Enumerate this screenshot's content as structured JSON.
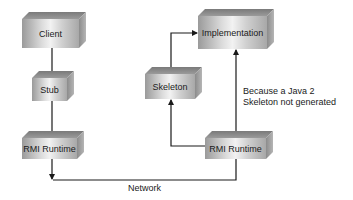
{
  "diagram": {
    "nodes": [
      {
        "id": "client",
        "label": "Client"
      },
      {
        "id": "stub",
        "label": "Stub"
      },
      {
        "id": "rmi_runtime_client",
        "label": "RMI Runtime"
      },
      {
        "id": "skeleton",
        "label": "Skeleton"
      },
      {
        "id": "implementation",
        "label": "Implementation"
      },
      {
        "id": "rmi_runtime_server",
        "label": "RMI Runtime"
      }
    ],
    "edges": [
      {
        "from": "client",
        "to": "stub",
        "arrow": false
      },
      {
        "from": "stub",
        "to": "rmi_runtime_client",
        "arrow": false
      },
      {
        "from": "rmi_runtime_client",
        "to": "network",
        "arrow": true
      },
      {
        "from": "rmi_runtime_server",
        "to": "network",
        "arrow": false
      },
      {
        "from": "rmi_runtime_server",
        "to": "skeleton",
        "arrow": true
      },
      {
        "from": "skeleton",
        "to": "implementation",
        "arrow": true
      },
      {
        "from": "rmi_runtime_server",
        "to": "implementation",
        "arrow": true
      }
    ],
    "network_label": "Network",
    "annotation": {
      "line1": "Because a Java 2",
      "line2": "Skeleton not generated"
    },
    "colors": {
      "line": "#1a1a1a",
      "box_light": "#f2f2f2",
      "box_dark": "#9a9a9a"
    }
  }
}
